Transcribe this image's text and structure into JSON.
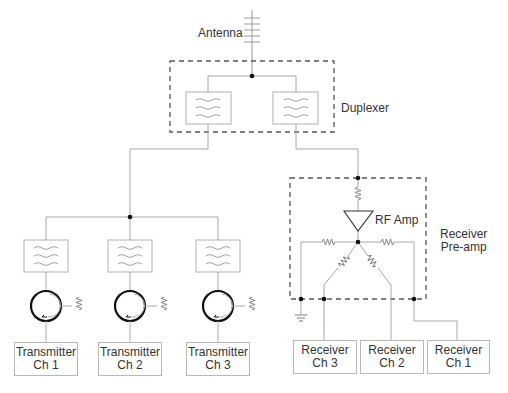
{
  "labels": {
    "antenna": "Antenna",
    "duplexer": "Duplexer",
    "rf_amp": "RF Amp",
    "preamp_line1": "Receiver",
    "preamp_line2": "Pre-amp"
  },
  "transmitters": [
    {
      "line1": "Transmitter",
      "line2": "Ch 1"
    },
    {
      "line1": "Transmitter",
      "line2": "Ch 2"
    },
    {
      "line1": "Transmitter",
      "line2": "Ch 3"
    }
  ],
  "receivers": [
    {
      "line1": "Receiver",
      "line2": "Ch 3"
    },
    {
      "line1": "Receiver",
      "line2": "Ch 2"
    },
    {
      "line1": "Receiver",
      "line2": "Ch 1"
    }
  ],
  "colors": {
    "wire": "#a8a8a8",
    "dashed_border": "#555555",
    "node": "#111111",
    "circulator": "#111111",
    "text": "#333333"
  }
}
